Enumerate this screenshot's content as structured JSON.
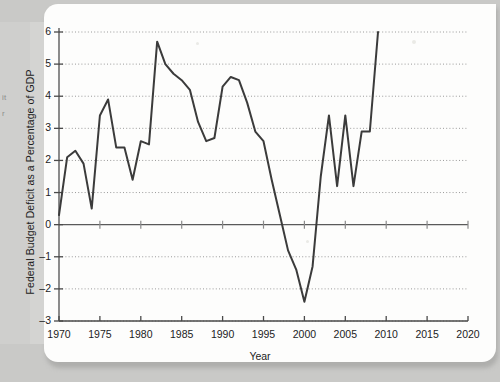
{
  "page": {
    "edge_note_lines": [
      "it",
      "r"
    ]
  },
  "chart_data": {
    "type": "line",
    "title": "",
    "xlabel": "Year",
    "ylabel": "Federal Budget Deficit as a Percentage of GDP",
    "xlim": [
      1970,
      2020
    ],
    "ylim": [
      -3,
      6
    ],
    "xticks": [
      1970,
      1975,
      1980,
      1985,
      1990,
      1995,
      2000,
      2005,
      2010,
      2015,
      2020
    ],
    "yticks": [
      -3,
      -2,
      -1,
      0,
      1,
      2,
      3,
      4,
      5,
      6
    ],
    "grid": true,
    "legend": "none",
    "series_color": "#3b3b3b",
    "zero_line": 0,
    "x": [
      1970,
      1971,
      1972,
      1973,
      1974,
      1975,
      1976,
      1977,
      1978,
      1979,
      1980,
      1981,
      1982,
      1983,
      1984,
      1985,
      1986,
      1987,
      1988,
      1989,
      1990,
      1991,
      1992,
      1993,
      1994,
      1995,
      1996,
      1997,
      1998,
      1999,
      2000,
      2001,
      2002,
      2003,
      2004,
      2005,
      2006,
      2007,
      2008,
      2009
    ],
    "values": [
      0.3,
      2.1,
      2.3,
      1.9,
      0.5,
      3.4,
      3.9,
      2.4,
      2.4,
      1.4,
      2.6,
      2.5,
      5.7,
      5.0,
      4.7,
      4.5,
      4.2,
      3.2,
      2.6,
      2.7,
      4.3,
      4.6,
      4.5,
      3.8,
      2.9,
      2.6,
      1.4,
      0.3,
      -0.8,
      -1.4,
      -2.4,
      -1.3,
      1.5,
      3.4,
      1.2,
      3.4,
      1.2,
      2.9,
      2.9,
      6.0
    ]
  }
}
